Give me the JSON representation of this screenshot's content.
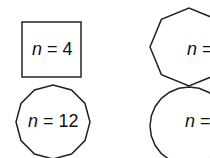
{
  "figure": {
    "shapes": [
      {
        "id": "square",
        "sides": 4,
        "label_var": "n",
        "label_eq": " = 4"
      },
      {
        "id": "octagon",
        "sides": 8,
        "label_var": "n",
        "label_eq": " ="
      },
      {
        "id": "dodecagon",
        "sides": 12,
        "label_var": "n",
        "label_eq": " = 12"
      },
      {
        "id": "many-gon",
        "sides": 24,
        "label_var": "n",
        "label_eq": " ="
      }
    ],
    "stroke_color": "#222222"
  }
}
